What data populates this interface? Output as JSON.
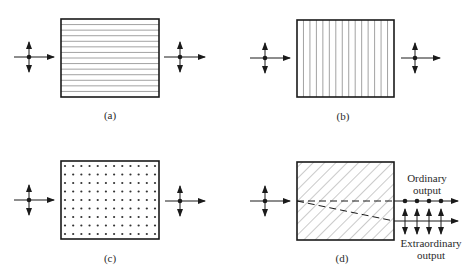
{
  "figure": {
    "panels": [
      {
        "id": "a",
        "label": "(a)",
        "pattern": "horizontal-lines",
        "box": {
          "x": 61,
          "y": 19,
          "w": 98,
          "h": 78
        },
        "lines": 13
      },
      {
        "id": "b",
        "label": "(b)",
        "pattern": "vertical-lines",
        "box": {
          "x": 297,
          "y": 20,
          "w": 97,
          "h": 77
        },
        "lines": 14
      },
      {
        "id": "c",
        "label": "(c)",
        "pattern": "dots",
        "box": {
          "x": 61,
          "y": 161,
          "w": 98,
          "h": 78
        },
        "cols": 12,
        "rows": 9
      },
      {
        "id": "d",
        "label": "(d)",
        "pattern": "diagonal-hatch",
        "box": {
          "x": 297,
          "y": 162,
          "w": 97,
          "h": 78
        }
      }
    ],
    "annotations": {
      "ordinary_line1": "Ordinary",
      "ordinary_line2": "output",
      "extraordinary_line1": "Extraordinary",
      "extraordinary_line2": "output"
    },
    "colors": {
      "stroke": "#1a1a1a",
      "pattern": "#8a8a8a",
      "text": "#2a2a2a"
    }
  }
}
